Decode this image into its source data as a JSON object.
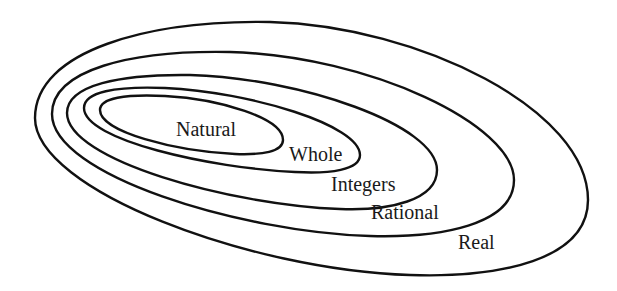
{
  "diagram": {
    "type": "nested-sets",
    "colors": {
      "stroke": "#111111",
      "text": "#1a1a1a",
      "background": "#ffffff"
    },
    "sets": [
      {
        "id": "natural",
        "label": "Natural"
      },
      {
        "id": "whole",
        "label": "Whole"
      },
      {
        "id": "integers",
        "label": "Integers"
      },
      {
        "id": "rational",
        "label": "Rational"
      },
      {
        "id": "real",
        "label": "Real"
      }
    ],
    "containment": [
      [
        "natural",
        "whole"
      ],
      [
        "whole",
        "integers"
      ],
      [
        "integers",
        "rational"
      ],
      [
        "rational",
        "real"
      ]
    ]
  }
}
